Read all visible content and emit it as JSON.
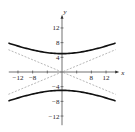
{
  "chart_data": {
    "type": "line",
    "title": "",
    "xlabel": "x",
    "ylabel": "y",
    "xlim": [
      -14.5,
      14.5
    ],
    "ylim": [
      -14.5,
      14.5
    ],
    "grid": false,
    "equation": "y^2/25 - x^2/144 = 1",
    "x_ticks": [
      -12,
      -8,
      -4,
      4,
      8,
      12
    ],
    "x_tick_labels": [
      "-12",
      "-8",
      "",
      "",
      "8",
      "12"
    ],
    "y_ticks": [
      -12,
      -8,
      -4,
      4,
      8,
      12
    ],
    "y_tick_labels": [
      "-12",
      "-8",
      "-4",
      "4",
      "8",
      "12"
    ],
    "series": [
      {
        "name": "upper branch",
        "style": "solid",
        "a": 5,
        "b": 12,
        "sign": 1
      },
      {
        "name": "lower branch",
        "style": "solid",
        "a": 5,
        "b": 12,
        "sign": -1
      },
      {
        "name": "asymptote y = 5x/12",
        "style": "dashed",
        "slope": 0.4167
      },
      {
        "name": "asymptote y = -5x/12",
        "style": "dashed",
        "slope": -0.4167
      }
    ],
    "colors": {
      "curve": "#111111",
      "asymptote": "#888888",
      "axis": "#333333"
    }
  }
}
